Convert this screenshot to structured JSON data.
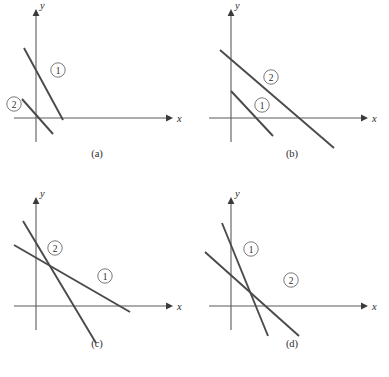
{
  "figure": {
    "kind": "line-graph-panels",
    "panel_count": 4,
    "line_color": "#4a4a4a",
    "axis_color": "#5a5a5a",
    "background": "#ffffff"
  },
  "axes": {
    "x_label": "x",
    "y_label": "y"
  },
  "panels": [
    {
      "id": "a",
      "caption": "(a)",
      "badges": [
        {
          "label": "1",
          "cx": 58,
          "cy": 70
        },
        {
          "label": "2",
          "cx": 14,
          "cy": 104
        }
      ],
      "lines": [
        {
          "label": "1",
          "x1": 63,
          "y1": 120,
          "x2": 24,
          "y2": 48
        },
        {
          "label": "2",
          "x1": 53,
          "y1": 134,
          "x2": 22,
          "y2": 99
        }
      ]
    },
    {
      "id": "b",
      "caption": "(b)",
      "badges": [
        {
          "label": "2",
          "cx": 76,
          "cy": 77
        },
        {
          "label": "1",
          "cx": 67,
          "cy": 105
        }
      ],
      "lines": [
        {
          "label": "2",
          "x1": 139,
          "y1": 148,
          "x2": 25,
          "y2": 50
        },
        {
          "label": "1",
          "x1": 78,
          "y1": 136,
          "x2": 36,
          "y2": 91
        }
      ]
    },
    {
      "id": "c",
      "caption": "(c)",
      "badges": [
        {
          "label": "2",
          "cx": 55,
          "cy": 60
        },
        {
          "label": "1",
          "cx": 105,
          "cy": 88
        }
      ],
      "lines": [
        {
          "label": "2",
          "x1": 96,
          "y1": 155,
          "x2": 23,
          "y2": 33
        },
        {
          "label": "1",
          "x1": 130,
          "y1": 124,
          "x2": 14,
          "y2": 57
        }
      ]
    },
    {
      "id": "d",
      "caption": "(d)",
      "badges": [
        {
          "label": "1",
          "cx": 56,
          "cy": 61
        },
        {
          "label": "2",
          "cx": 96,
          "cy": 92
        }
      ],
      "lines": [
        {
          "label": "1",
          "x1": 73,
          "y1": 148,
          "x2": 27,
          "y2": 35
        },
        {
          "label": "2",
          "x1": 104,
          "y1": 148,
          "x2": 10,
          "y2": 64
        }
      ]
    }
  ],
  "axis_geometry": {
    "origin_x": 36,
    "origin_y": 118,
    "x_axis_end": 166,
    "y_axis_top": 16,
    "y_axis_bottom": 142
  }
}
